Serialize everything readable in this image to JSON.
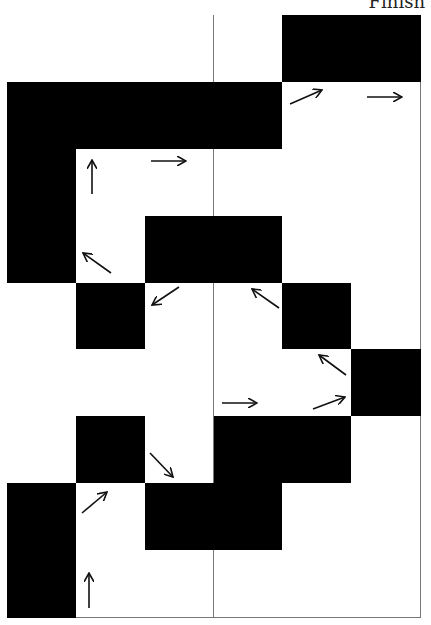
{
  "label": "Finish",
  "grid": {
    "cols": 6,
    "rows": 9,
    "black_cells": [
      [
        0,
        4
      ],
      [
        0,
        5
      ],
      [
        1,
        0
      ],
      [
        1,
        1
      ],
      [
        1,
        2
      ],
      [
        1,
        3
      ],
      [
        2,
        0
      ],
      [
        3,
        0
      ],
      [
        3,
        2
      ],
      [
        3,
        3
      ],
      [
        4,
        1
      ],
      [
        4,
        4
      ],
      [
        5,
        5
      ],
      [
        6,
        1
      ],
      [
        6,
        3
      ],
      [
        6,
        4
      ],
      [
        7,
        0
      ],
      [
        7,
        2
      ],
      [
        7,
        3
      ],
      [
        8,
        0
      ]
    ]
  },
  "arrows": [
    {
      "row": 1,
      "col": 4,
      "dir": "up-right"
    },
    {
      "row": 1,
      "col": 5,
      "dir": "right"
    },
    {
      "row": 2,
      "col": 1,
      "dir": "up"
    },
    {
      "row": 2,
      "col": 2,
      "dir": "right"
    },
    {
      "row": 3,
      "col": 1,
      "dir": "up-left"
    },
    {
      "row": 4,
      "col": 2,
      "dir": "down-left"
    },
    {
      "row": 4,
      "col": 3,
      "dir": "up-left"
    },
    {
      "row": 5,
      "col": 3,
      "dir": "right"
    },
    {
      "row": 5,
      "col": 4,
      "dir": "up-left"
    },
    {
      "row": 5,
      "col": 4,
      "dir": "up-right"
    },
    {
      "row": 6,
      "col": 2,
      "dir": "down-right"
    },
    {
      "row": 7,
      "col": 1,
      "dir": "up-right"
    },
    {
      "row": 8,
      "col": 1,
      "dir": "up"
    }
  ]
}
